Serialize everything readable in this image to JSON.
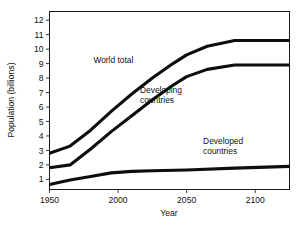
{
  "chart_data": {
    "type": "line",
    "title": "",
    "subtitle": "",
    "xlabel": "Year",
    "ylabel": "Population (billions)",
    "xlim": [
      1950,
      2125
    ],
    "ylim": [
      0.3,
      12.6
    ],
    "xticks": [
      1950,
      2000,
      2050,
      2100
    ],
    "xtick_labels": [
      "1950",
      "2000",
      "2050",
      "2100"
    ],
    "yticks": [
      1,
      2,
      3,
      4,
      5,
      6,
      7,
      8,
      9,
      10,
      11,
      12
    ],
    "ytick_labels": [
      "1",
      "2",
      "3",
      "4",
      "5",
      "6",
      "7",
      "8",
      "9",
      "10",
      "11",
      "12"
    ],
    "grid": false,
    "legend_position": "inline-annotations",
    "series": [
      {
        "name": "World total",
        "label": "World total",
        "color": "#0d0d0d",
        "x": [
          1950,
          1965,
          1980,
          1995,
          2010,
          2025,
          2040,
          2050,
          2065,
          2085,
          2125
        ],
        "values": [
          2.8,
          3.3,
          4.4,
          5.7,
          6.9,
          8.0,
          9.0,
          9.6,
          10.2,
          10.6,
          10.6
        ]
      },
      {
        "name": "Developing countries",
        "label": "Developing countries",
        "color": "#0d0d0d",
        "x": [
          1950,
          1965,
          1980,
          1995,
          2010,
          2025,
          2040,
          2050,
          2065,
          2085,
          2125
        ],
        "values": [
          1.8,
          2.0,
          3.1,
          4.3,
          5.4,
          6.5,
          7.5,
          8.1,
          8.6,
          8.9,
          8.9
        ]
      },
      {
        "name": "Developed countries",
        "label": "Developed countries",
        "color": "#0d0d0d",
        "x": [
          1950,
          1965,
          1980,
          1995,
          2010,
          2025,
          2050,
          2085,
          2125
        ],
        "values": [
          0.65,
          0.95,
          1.2,
          1.45,
          1.55,
          1.6,
          1.65,
          1.78,
          1.9
        ]
      }
    ],
    "annotations": [
      {
        "text": "World total",
        "x": 1982,
        "y": 9.05,
        "name": "world-total-label"
      },
      {
        "text": "Developing",
        "x": 2016,
        "y": 6.95,
        "name": "developing-label-line1"
      },
      {
        "text": "countries",
        "x": 2016,
        "y": 6.25,
        "name": "developing-label-line2"
      },
      {
        "text": "Developed",
        "x": 2062,
        "y": 3.45,
        "name": "developed-label-line1"
      },
      {
        "text": "countries",
        "x": 2062,
        "y": 2.75,
        "name": "developed-label-line2"
      }
    ]
  },
  "colors": {
    "line": "#0d0d0d",
    "axis": "#1a1a1a",
    "text": "#111111",
    "background": "#ffffff"
  }
}
